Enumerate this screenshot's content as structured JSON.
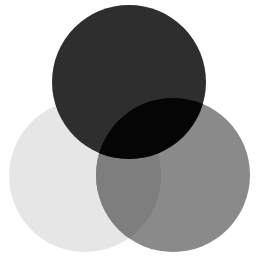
{
  "diagram": {
    "type": "venn",
    "sets": 3,
    "circles": [
      {
        "id": "left",
        "cx": 85,
        "cy": 176,
        "r": 76,
        "fill": "#e6e6e6"
      },
      {
        "id": "right",
        "cx": 173,
        "cy": 175,
        "r": 77,
        "fill": "#8a8a8a"
      },
      {
        "id": "top",
        "cx": 129,
        "cy": 82,
        "r": 77,
        "fill": "#2e2e2e"
      }
    ],
    "overlaps": {
      "left_right": "#7e7e7e",
      "top_right": "#050505",
      "top_left": "#2e2e2e"
    },
    "background": "#ffffff"
  }
}
